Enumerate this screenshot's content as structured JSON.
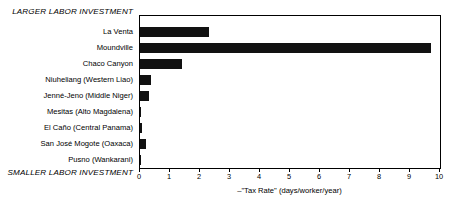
{
  "chart_data": {
    "type": "bar",
    "orientation": "horizontal",
    "title": "",
    "xlabel": "–\"Tax Rate\" (days/worker/year)",
    "ylabel": "",
    "xlim": [
      0,
      10
    ],
    "xticks": [
      "0",
      "1",
      "2",
      "3",
      "4",
      "5",
      "6",
      "7",
      "8",
      "9",
      "10"
    ],
    "grid": false,
    "legend": false,
    "bar_color": "#111111",
    "frame_color": "#000000",
    "categories": [
      "La Venta",
      "Moundville",
      "Chaco Canyon",
      "Niuheliang (Western Liao)",
      "Jenné-Jeno (Middle Niger)",
      "Mesitas (Alto Magdalena)",
      "El Caño (Central Panama)",
      "San José Mogote (Oaxaca)",
      "Pusno (Wankarani)"
    ],
    "values": [
      2.3,
      9.7,
      1.4,
      0.35,
      0.3,
      0.02,
      0.06,
      0.2,
      0.01
    ],
    "annotations": {
      "top": "LARGER LABOR INVESTMENT",
      "bottom": "SMALLER LABOR INVESTMENT"
    }
  }
}
